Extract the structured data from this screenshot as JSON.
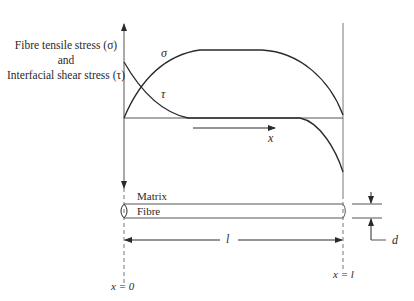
{
  "diagram": {
    "y_axis_label": {
      "line1": "Fibre tensile stress (σ)",
      "line2": "and",
      "line3": "Interfacial shear stress (τ)"
    },
    "curves": {
      "sigma_label": "σ",
      "tau_label": "τ"
    },
    "x_direction_label": "x",
    "fibre": {
      "matrix_label": "Matrix",
      "fibre_label": "Fibre",
      "diameter_label": "d"
    },
    "length_label": "l",
    "x_start_label": "x = 0",
    "x_end_label": "x = l",
    "colors": {
      "line": "#2a2a2a",
      "axis": "#555555",
      "background": "#ffffff"
    }
  }
}
